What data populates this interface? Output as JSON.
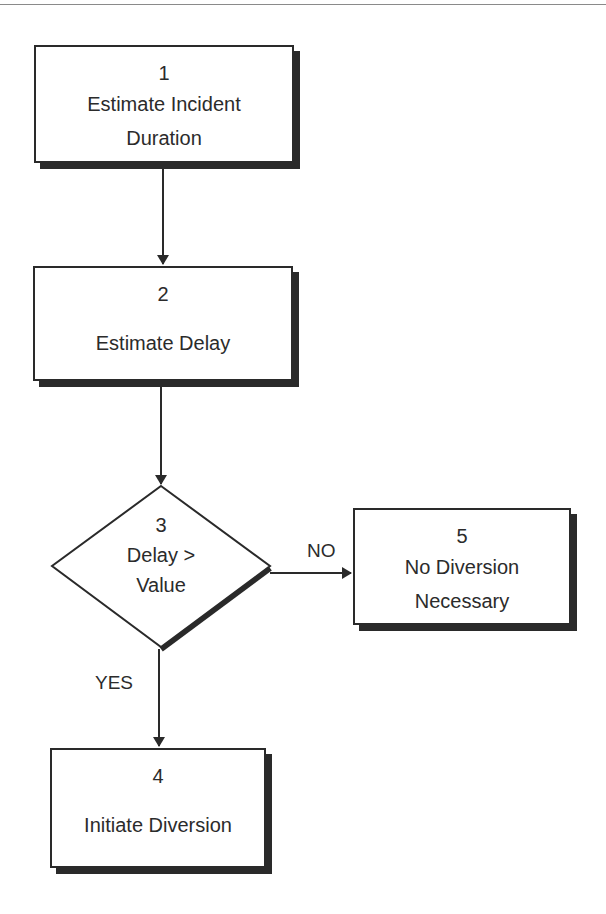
{
  "diagram": {
    "type": "flowchart",
    "nodes": [
      {
        "id": "1",
        "shape": "rectangle",
        "number": "1",
        "label_line1": "Estimate Incident",
        "label_line2": "Duration"
      },
      {
        "id": "2",
        "shape": "rectangle",
        "number": "2",
        "label_line1": "Estimate Delay"
      },
      {
        "id": "3",
        "shape": "diamond",
        "number": "3",
        "label_line1": "Delay >",
        "label_line2": "Value"
      },
      {
        "id": "4",
        "shape": "rectangle",
        "number": "4",
        "label_line1": "Initiate Diversion"
      },
      {
        "id": "5",
        "shape": "rectangle",
        "number": "5",
        "label_line1": "No Diversion",
        "label_line2": "Necessary"
      }
    ],
    "edges": [
      {
        "from": "1",
        "to": "2",
        "label": ""
      },
      {
        "from": "2",
        "to": "3",
        "label": ""
      },
      {
        "from": "3",
        "to": "5",
        "label": "NO"
      },
      {
        "from": "3",
        "to": "4",
        "label": "YES"
      }
    ],
    "colors": {
      "stroke": "#2a2a2a",
      "shadow": "#2a2a2a",
      "background": "#ffffff"
    }
  }
}
